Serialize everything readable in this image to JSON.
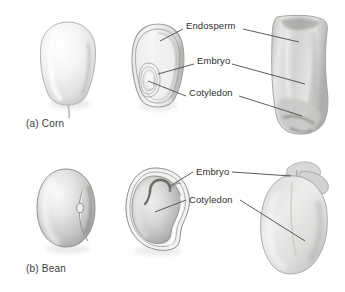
{
  "figure": {
    "background": "#ffffff",
    "line_color": "#4a4a4a",
    "text_color": "#2e2e2e"
  },
  "panels": [
    {
      "id": "corn",
      "caption": "(a) Corn",
      "specimens": [
        {
          "name": "whole-corn-kernel",
          "view": "whole seed, exterior"
        },
        {
          "name": "corn-longitudinal-section",
          "view": "longitudinal section diagram"
        },
        {
          "name": "corn-kernel-photo",
          "view": "photograph of sectioned kernel"
        }
      ],
      "labels": [
        {
          "text": "Endosperm",
          "x": 186,
          "y": 26
        },
        {
          "text": "Embryo",
          "x": 197,
          "y": 61
        },
        {
          "text": "Cotyledon",
          "x": 189,
          "y": 93
        }
      ]
    },
    {
      "id": "bean",
      "caption": "(b) Bean",
      "specimens": [
        {
          "name": "whole-bean-seed",
          "view": "whole seed, exterior"
        },
        {
          "name": "bean-longitudinal-section",
          "view": "longitudinal section diagram"
        },
        {
          "name": "bean-seed-photo",
          "view": "photograph of opened bean seed"
        }
      ],
      "labels": [
        {
          "text": "Embryo",
          "x": 196,
          "y": 166
        },
        {
          "text": "Cotyledon",
          "x": 189,
          "y": 194
        }
      ]
    }
  ]
}
